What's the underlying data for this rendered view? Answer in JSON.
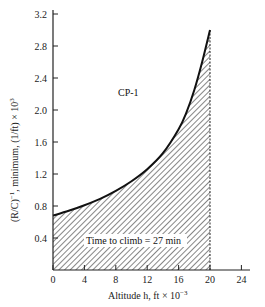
{
  "chart_data": {
    "type": "area",
    "title": "",
    "series_label": "CP-1",
    "xlabel": "Altitude h, ft × 10⁻³",
    "ylabel": "(R/C)⁻¹, minimum, (1/ft) × 10³",
    "xlim": [
      0,
      24
    ],
    "ylim": [
      0,
      3.2
    ],
    "x_ticks": [
      0,
      4,
      8,
      12,
      16,
      20,
      24
    ],
    "y_ticks": [
      0.4,
      0.8,
      1.2,
      1.6,
      2.0,
      2.4,
      2.8,
      3.2
    ],
    "grid": false,
    "legend": "none",
    "series": [
      {
        "name": "CP-1",
        "x": [
          0,
          2,
          4,
          6,
          8,
          10,
          12,
          14,
          16,
          17,
          18,
          19,
          20
        ],
        "y": [
          0.68,
          0.74,
          0.81,
          0.89,
          0.99,
          1.11,
          1.26,
          1.46,
          1.76,
          1.97,
          2.25,
          2.6,
          3.0
        ]
      }
    ],
    "shaded_region": {
      "x_from": 0,
      "x_to": 20,
      "fill": "hatched",
      "label": "Time to climb = 27 min"
    },
    "annotations": [
      "CP-1",
      "Time to climb = 27 min"
    ]
  },
  "labels": {
    "series_tag": "CP-1",
    "area_label": "Time to climb = 27 min",
    "x_axis_title": "Altitude h, ft × 10",
    "x_axis_exp": "−3",
    "y_axis_title_main": "(R/C)",
    "y_axis_title_exp1": "−1",
    "y_axis_title_rest": ", minimum, (1/ft) × 10",
    "y_axis_title_exp2": "3"
  },
  "colors": {
    "line": "#111111",
    "hatch": "#222222",
    "axis": "#222222",
    "background": "#ffffff"
  }
}
